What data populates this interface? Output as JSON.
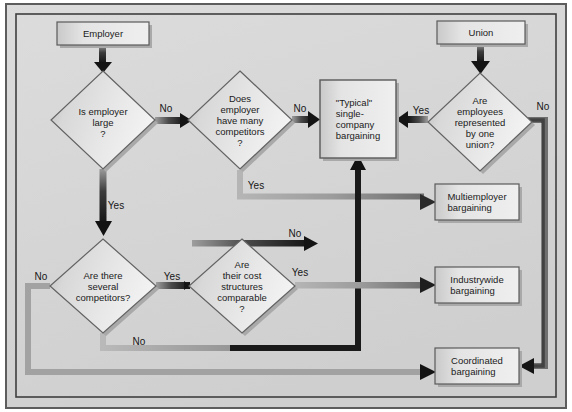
{
  "diagram": {
    "frame": {
      "outer_border_color": "#4a4a4a",
      "background_color": "#d6d6d6",
      "inner_border_color": "#3c3c3c"
    },
    "colors": {
      "box_fill_light": "#e8e8e8",
      "box_fill_dark": "#b4b4b4",
      "box_border": "#5a5a5a",
      "shadow": "#9a9a9a",
      "arrow_dark": "#1d1d1d",
      "arrow_light": "#a8a8a8",
      "text": "#1a1a1a"
    },
    "nodes": [
      {
        "id": "employer",
        "type": "terminal",
        "label": "Employer",
        "cx": 103,
        "cy": 33,
        "w": 92,
        "h": 23
      },
      {
        "id": "union",
        "type": "terminal",
        "label": "Union",
        "cx": 481,
        "cy": 32,
        "w": 88,
        "h": 23
      },
      {
        "id": "is_employer_large",
        "type": "decision",
        "label": "Is employer\nlarge\n?",
        "cx": 103,
        "cy": 120,
        "w": 104,
        "h": 98
      },
      {
        "id": "many_competitors",
        "type": "decision",
        "label": "Does\nemployer\nhave many\ncompetitors\n?",
        "cx": 240,
        "cy": 120,
        "w": 104,
        "h": 98
      },
      {
        "id": "one_union",
        "type": "decision",
        "label": "Are\nemployees\nrepresented\nby one\nunion?",
        "cx": 480,
        "cy": 122,
        "w": 104,
        "h": 98
      },
      {
        "id": "several_competitors",
        "type": "decision",
        "label": "Are there\nseveral\ncompetitors?",
        "cx": 103,
        "cy": 286,
        "w": 106,
        "h": 94
      },
      {
        "id": "cost_structures",
        "type": "decision",
        "label": "Are\ntheir cost\nstructures\ncomparable\n?",
        "cx": 242,
        "cy": 286,
        "w": 106,
        "h": 94
      },
      {
        "id": "typical_single",
        "type": "process",
        "label": "\"Typical\"\nsingle-\ncompany\nbargaining",
        "cx": 358,
        "cy": 119,
        "w": 76,
        "h": 78
      },
      {
        "id": "multiemployer",
        "type": "process",
        "label": "Multiemployer\nbargaining",
        "cx": 477,
        "cy": 202,
        "w": 84,
        "h": 36
      },
      {
        "id": "industrywide",
        "type": "process",
        "label": "Industrywide\nbargaining",
        "cx": 477,
        "cy": 285,
        "w": 84,
        "h": 36
      },
      {
        "id": "coordinated",
        "type": "process",
        "label": "Coordinated\nbargaining",
        "cx": 477,
        "cy": 366,
        "w": 84,
        "h": 36
      }
    ],
    "edges": [
      {
        "id": "e1",
        "from": "employer",
        "to": "is_employer_large",
        "label": "",
        "style": "dark"
      },
      {
        "id": "e2",
        "from": "is_employer_large",
        "to": "many_competitors",
        "label": "No",
        "style": "dark",
        "label_x": 166,
        "label_y": 108
      },
      {
        "id": "e3",
        "from": "is_employer_large",
        "to": "several_competitors",
        "label": "Yes",
        "style": "dark",
        "label_x": 116,
        "label_y": 205
      },
      {
        "id": "e4",
        "from": "many_competitors",
        "to": "typical_single",
        "label": "No",
        "style": "dark",
        "label_x": 300,
        "label_y": 108
      },
      {
        "id": "e5",
        "from": "many_competitors",
        "to": "multiemployer",
        "label": "Yes",
        "style": "light",
        "label_x": 256,
        "label_y": 185
      },
      {
        "id": "e6",
        "from": "union",
        "to": "one_union",
        "label": "",
        "style": "dark"
      },
      {
        "id": "e7",
        "from": "one_union",
        "to": "typical_single",
        "label": "Yes",
        "style": "dark",
        "label_x": 421,
        "label_y": 110
      },
      {
        "id": "e8",
        "from": "one_union",
        "to": "coordinated",
        "label": "No",
        "style": "light",
        "label_x": 543,
        "label_y": 106
      },
      {
        "id": "e9",
        "from": "several_competitors",
        "to": "cost_structures",
        "label": "Yes",
        "style": "dark",
        "label_x": 172,
        "label_y": 276
      },
      {
        "id": "e10",
        "from": "several_competitors",
        "to": "coordinated",
        "label": "No",
        "style": "light",
        "label_x": 41,
        "label_y": 276
      },
      {
        "id": "e11",
        "from": "several_competitors",
        "to": "typical_single",
        "label": "No",
        "style": "light",
        "label_x": 139,
        "label_y": 341
      },
      {
        "id": "e12",
        "from": "cost_structures",
        "to": "typical_single",
        "label": "No",
        "style": "dark",
        "label_x": 295,
        "label_y": 233
      },
      {
        "id": "e13",
        "from": "cost_structures",
        "to": "industrywide",
        "label": "Yes",
        "style": "light",
        "label_x": 300,
        "label_y": 272
      }
    ]
  }
}
